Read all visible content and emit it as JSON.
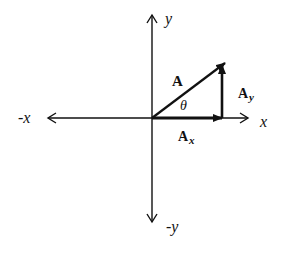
{
  "diagram": {
    "axes": {
      "pos_x_label": "x",
      "neg_x_label": "-x",
      "pos_y_label": "y",
      "neg_y_label": "-y"
    },
    "vector": {
      "label": "A",
      "angle_label": "θ"
    },
    "components": {
      "x_label_main": "A",
      "x_label_sub": "x",
      "y_label_main": "A",
      "y_label_sub": "y"
    },
    "colors": {
      "line": "#111111",
      "background": "#ffffff"
    }
  }
}
